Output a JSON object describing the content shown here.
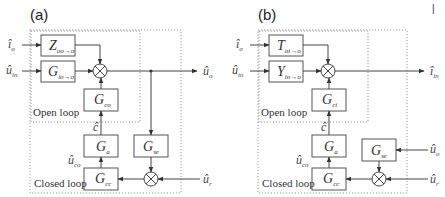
{
  "corner_mark": "|",
  "panels": [
    {
      "label": "(a)",
      "inputs": {
        "top": {
          "base": "î",
          "sub": "o"
        },
        "mid": {
          "base": "û",
          "sub": "in"
        },
        "right_lower": {
          "base": "û",
          "sub": "r"
        }
      },
      "output": {
        "base": "û",
        "sub": "o"
      },
      "blocks": {
        "top": {
          "base": "Z",
          "sub": "oo→o"
        },
        "mid": {
          "base": "G",
          "sub": "io→o"
        },
        "control": {
          "base": "G",
          "sub": "co"
        },
        "actuator": {
          "base": "G",
          "sub": "a"
        },
        "controller": {
          "base": "G",
          "sub": "cc"
        },
        "sensor": {
          "base": "G",
          "sub": "se"
        }
      },
      "signals": {
        "c": {
          "base": "ĉ",
          "sub": ""
        },
        "uco": {
          "base": "û",
          "sub": "co"
        }
      },
      "open_loop_label": "Open loop",
      "closed_loop_label": "Closed loop"
    },
    {
      "label": "(b)",
      "inputs": {
        "top": {
          "base": "î",
          "sub": "o"
        },
        "mid": {
          "base": "û",
          "sub": "in"
        },
        "right_upper": {
          "base": "û",
          "sub": "o"
        },
        "right_lower": {
          "base": "û",
          "sub": "r"
        }
      },
      "output": {
        "base": "î",
        "sub": "in"
      },
      "blocks": {
        "top": {
          "base": "T",
          "sub": "oi→o"
        },
        "mid": {
          "base": "Y",
          "sub": "in→o"
        },
        "control": {
          "base": "G",
          "sub": "ci"
        },
        "actuator": {
          "base": "G",
          "sub": "a"
        },
        "controller": {
          "base": "G",
          "sub": "cc"
        },
        "sensor": {
          "base": "G",
          "sub": "se"
        }
      },
      "signals": {
        "c": {
          "base": "ĉ",
          "sub": ""
        },
        "uco": {
          "base": "û",
          "sub": "co"
        }
      },
      "open_loop_label": "Open loop",
      "closed_loop_label": "Closed loop"
    }
  ],
  "colors": {
    "line": "#444444",
    "box_stroke": "#555555",
    "dotted": "#999999",
    "text": "#333333"
  }
}
